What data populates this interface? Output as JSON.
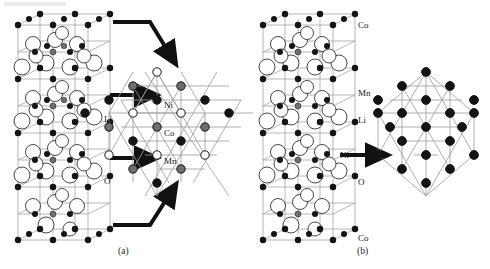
{
  "figure": {
    "kind": "crystal-structure-diagram",
    "background": "#ffffff",
    "ink": "#111111"
  },
  "panels": [
    {
      "id": "a",
      "caption": "(a)",
      "cell_labels": [
        {
          "text": "Li",
          "x": 104,
          "y": 120
        },
        {
          "text": "O",
          "x": 104,
          "y": 182
        }
      ],
      "lattice_labels": [
        {
          "text": "Ni",
          "x": 176,
          "y": 107
        },
        {
          "text": "Co",
          "x": 176,
          "y": 135
        },
        {
          "text": "Mn",
          "x": 176,
          "y": 162
        }
      ],
      "arrows": [
        {
          "type": "bent-down",
          "x1": 113,
          "y1": 22,
          "x2": 152,
          "y2": 22,
          "x3": 170,
          "y3": 52
        },
        {
          "type": "straight",
          "x1": 110,
          "y1": 95,
          "x2": 141,
          "y2": 95
        },
        {
          "type": "straight",
          "x1": 110,
          "y1": 158,
          "x2": 141,
          "y2": 158
        },
        {
          "type": "bent-up",
          "x1": 113,
          "y1": 225,
          "x2": 152,
          "y2": 225,
          "x3": 170,
          "y3": 196
        }
      ],
      "lattice": {
        "center_x": 180,
        "center_y": 126,
        "site_types": [
          "Ni",
          "Co",
          "Mn"
        ],
        "site_count": 19,
        "note": "Ordered triangular lattice, three metal species alternating"
      }
    },
    {
      "id": "b",
      "caption": "(b)",
      "cell_labels": [
        {
          "text": "Co",
          "x": 352,
          "y": 27
        },
        {
          "text": "Mn",
          "x": 352,
          "y": 95
        },
        {
          "text": "Li",
          "x": 352,
          "y": 121
        },
        {
          "text": "Ni",
          "x": 352,
          "y": 157
        },
        {
          "text": "O",
          "x": 352,
          "y": 183
        },
        {
          "text": "Co",
          "x": 352,
          "y": 240
        }
      ],
      "lattice_labels": [],
      "arrows": [
        {
          "type": "straight",
          "x1": 340,
          "y1": 155,
          "x2": 372,
          "y2": 155
        }
      ],
      "lattice": {
        "center_x": 425,
        "center_y": 133,
        "site_types": [
          "M"
        ],
        "site_count": 19,
        "note": "Disordered / uniform triangular lattice, single site colour"
      }
    }
  ],
  "legend": {
    "site_colors": {
      "open": "#ffffff",
      "gray": "#7a7a7a",
      "filled": "#141414",
      "outline": "#141414",
      "bond": "#9a9a9a",
      "oxygen_fill": "#ffffff"
    },
    "species": [
      {
        "name": "Ni",
        "style": "open"
      },
      {
        "name": "Mn",
        "style": "gray"
      },
      {
        "name": "Co",
        "style": "filled"
      },
      {
        "name": "Li",
        "style": "filled-small"
      },
      {
        "name": "O",
        "style": "large-open"
      }
    ]
  }
}
